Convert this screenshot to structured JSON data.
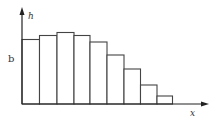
{
  "chart_data": {
    "type": "bar",
    "title": "",
    "xlabel": "x",
    "ylabel": "h",
    "y_marker_label": "b",
    "categories": [
      "1",
      "2",
      "3",
      "4",
      "5",
      "6",
      "7",
      "8",
      "9"
    ],
    "values": [
      64.5,
      68.5,
      71.5,
      68.5,
      62,
      49,
      35,
      19,
      8
    ],
    "grid": false,
    "legend": "none",
    "bar_fill": "#ffffff",
    "bar_stroke": "#444444"
  },
  "labels": {
    "y_axis": "h",
    "x_axis": "x",
    "marker": "b"
  },
  "layout": {
    "origin_x": 22,
    "baseline_y": 104,
    "bar_edges": [
      22,
      39.5,
      57,
      74,
      90,
      107,
      124,
      140.5,
      157,
      172.5
    ]
  }
}
